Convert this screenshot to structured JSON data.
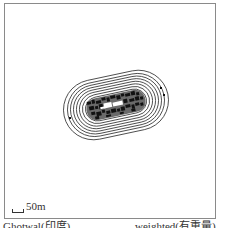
{
  "figure": {
    "type": "contour density map",
    "frame_border_color": "#8a8a8a",
    "contour_color": "#333333"
  },
  "scale_bar": {
    "label": "50m"
  },
  "captions": {
    "left": "Ghotwal(印度)",
    "right": "weighted(有重量)"
  },
  "contours": {
    "center": [
      116,
      105
    ],
    "rotation_deg": -12,
    "rings": [
      {
        "rx": 53,
        "ry": 30
      },
      {
        "rx": 49,
        "ry": 27
      },
      {
        "rx": 46,
        "ry": 24.5
      },
      {
        "rx": 43,
        "ry": 22
      },
      {
        "rx": 40,
        "ry": 19.5
      },
      {
        "rx": 37,
        "ry": 17
      },
      {
        "rx": 34,
        "ry": 14.5
      },
      {
        "rx": 31,
        "ry": 12
      }
    ]
  }
}
